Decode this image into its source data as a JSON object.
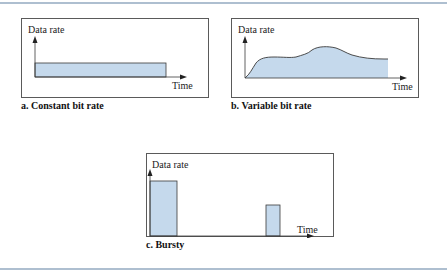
{
  "figure": {
    "panels": [
      {
        "id": "a",
        "caption": "a. Constant bit rate",
        "ylabel": "Data rate",
        "xlabel": "Time"
      },
      {
        "id": "b",
        "caption": "b. Variable bit rate",
        "ylabel": "Data rate",
        "xlabel": "Time"
      },
      {
        "id": "c",
        "caption": "c. Bursty",
        "ylabel": "Data rate",
        "xlabel": "Time"
      }
    ],
    "colors": {
      "fill": "#c5d9ec",
      "stroke": "#3a3a3a",
      "frame": "#5a5a5a",
      "rule": "#aebfd0"
    }
  }
}
